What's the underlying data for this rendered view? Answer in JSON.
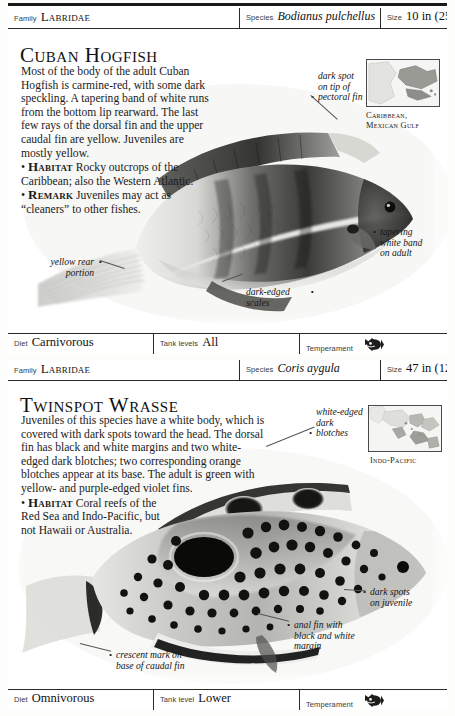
{
  "page": {
    "entries": [
      {
        "id": "cuban-hogfish",
        "header": {
          "family_label": "Family",
          "family_value": "Labridae",
          "species_label": "Species",
          "species_value": "Bodianus pulchellus",
          "size_label": "Size",
          "size_value": "10 in (25 cm)"
        },
        "title": "Cuban Hogfish",
        "description": {
          "main": "Most of the body of the adult Cuban Hogfish is carmine-red, with some dark speckling. A tapering band of white runs from the bottom lip rearward. The last few rays of the dorsal fin and the upper caudal fin are yellow. Juveniles are mostly yellow.",
          "habitat_kw": "Habitat",
          "habitat": "Rocky outcrops of the Caribbean; also the Western Atlantic.",
          "remark_kw": "Remark",
          "remark": "Juveniles may act as “cleaners” to other fishes."
        },
        "callouts": [
          {
            "name": "dark-spot-pectoral",
            "text": "dark spot\non tip of\npectoral fin"
          },
          {
            "name": "tapering-white-band",
            "text": "tapering\nwhite band\non adult"
          },
          {
            "name": "yellow-rear-portion",
            "text": "yellow rear\nportion"
          },
          {
            "name": "dark-edged-scales",
            "text": "dark-edged\nscales"
          }
        ],
        "map_caption": "Caribbean,\nMexican Gulf",
        "footer": {
          "diet_label": "Diet",
          "diet_value": "Carnivorous",
          "tank_label": "Tank levels",
          "tank_value": "All",
          "temperament_label": "Temperament",
          "temperament_icon": "aggressive-fish-icon"
        }
      },
      {
        "id": "twinspot-wrasse",
        "header": {
          "family_label": "Family",
          "family_value": "Labridae",
          "species_label": "Species",
          "species_value": "Coris aygula",
          "size_label": "Size",
          "size_value": "47 in (120 cm)"
        },
        "title": "Twinspot Wrasse",
        "description": {
          "main": "Juveniles of this species have a white body, which is covered with dark spots toward the head. The dorsal fin has black and white margins and two white-edged dark blotches; two corresponding orange blotches appear at its base. The adult is green with yellow- and purple-edged violet fins.",
          "habitat_kw": "Habitat",
          "habitat": "Coral reefs of the Red Sea and Indo-Pacific, but not Hawaii or Australia."
        },
        "callouts": [
          {
            "name": "white-edged-dark-blotches",
            "text": "white-edged\ndark\nblotches"
          },
          {
            "name": "dark-spots-on-juvenile",
            "text": "dark spots\non juvenile"
          },
          {
            "name": "anal-fin-margin",
            "text": "anal fin with\nblack and white\nmargin"
          },
          {
            "name": "crescent-mark-caudal",
            "text": "crescent mark on\nbase of caudal fin"
          }
        ],
        "map_caption": "Indo-Pacific",
        "footer": {
          "diet_label": "Diet",
          "diet_value": "Omnivorous",
          "tank_label": "Tank level",
          "tank_value": "Lower",
          "temperament_label": "Temperament",
          "temperament_icon": "aggressive-fish-icon"
        }
      }
    ]
  },
  "colors": {
    "rule": "#1a1a1a",
    "border": "#2a2a2a",
    "text": "#1b1b1b",
    "paper": "#ffffff"
  }
}
